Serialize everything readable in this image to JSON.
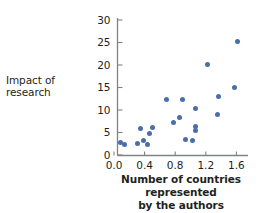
{
  "chart_data": {
    "type": "scatter",
    "title": "",
    "xlabel": "Number of countries represented by the authors",
    "ylabel": "Impact of research",
    "xlabel_line1": "Number of countries represented",
    "xlabel_line2": "by the authors",
    "xlim": [
      0.0,
      1.7
    ],
    "ylim": [
      0,
      31
    ],
    "xticks": [
      "0.0",
      "0.4",
      "0.8",
      "1.2",
      "1.6"
    ],
    "xtick_values": [
      0.0,
      0.4,
      0.8,
      1.2,
      1.6
    ],
    "yticks": [
      "0",
      "5",
      "10",
      "15",
      "20",
      "25",
      "30"
    ],
    "ytick_values": [
      0,
      5,
      10,
      15,
      20,
      25,
      30
    ],
    "grid": false,
    "legend": false,
    "marker_color": "#4a6ea9",
    "axis_color": "#808285",
    "points": [
      {
        "x": 0.09,
        "y": 2.8
      },
      {
        "x": 0.14,
        "y": 2.4
      },
      {
        "x": 0.31,
        "y": 2.6
      },
      {
        "x": 0.35,
        "y": 5.8
      },
      {
        "x": 0.38,
        "y": 3.3
      },
      {
        "x": 0.44,
        "y": 2.4
      },
      {
        "x": 0.47,
        "y": 4.7
      },
      {
        "x": 0.5,
        "y": 6.1
      },
      {
        "x": 0.69,
        "y": 12.4
      },
      {
        "x": 0.78,
        "y": 7.3
      },
      {
        "x": 0.86,
        "y": 8.4
      },
      {
        "x": 0.9,
        "y": 12.4
      },
      {
        "x": 0.93,
        "y": 3.4
      },
      {
        "x": 1.03,
        "y": 3.3
      },
      {
        "x": 1.06,
        "y": 6.4
      },
      {
        "x": 1.07,
        "y": 5.5
      },
      {
        "x": 1.07,
        "y": 10.4
      },
      {
        "x": 1.22,
        "y": 20.2
      },
      {
        "x": 1.35,
        "y": 8.9
      },
      {
        "x": 1.36,
        "y": 12.9
      },
      {
        "x": 1.57,
        "y": 14.9
      },
      {
        "x": 1.62,
        "y": 25.3
      }
    ]
  }
}
